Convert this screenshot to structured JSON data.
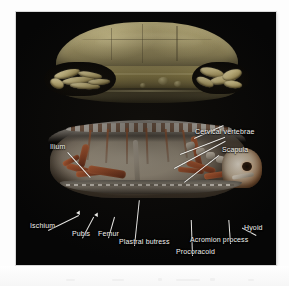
{
  "figure": {
    "background_color": "#060606",
    "panels": [
      {
        "id": "shell-view",
        "name": "external-shell-ct-render",
        "description": "Volume-rendered external view of turtle shell, lateral aspect",
        "palette": {
          "carapace": "#93885c",
          "bridge": "#7e7244",
          "bone": "#d6c78c",
          "shadow": "#2a2718"
        }
      },
      {
        "id": "skeleton-view",
        "name": "internal-skeleton-ct-render",
        "description": "Cutaway sagittal CT render showing internal skeleton of turtle",
        "palette": {
          "bone_red": "#a04d2a",
          "bone_pale": "#bcb2a2",
          "plastron": "#8a8276",
          "carapace_edge": "#a9a49c"
        }
      }
    ],
    "annotations": [
      {
        "id": "ilium",
        "label": "Ilium",
        "text_x": 50,
        "text_y": 147,
        "anchor_x": 84,
        "anchor_y": 178
      },
      {
        "id": "cervical-vertebrae",
        "label": "Cervical vertebrae",
        "text_x": 195,
        "text_y": 132,
        "anchor_x": 176,
        "anchor_y": 156
      },
      {
        "id": "scapula",
        "label": "Scapula",
        "text_x": 222,
        "text_y": 150,
        "anchor_x": 186,
        "anchor_y": 188
      },
      {
        "id": "ischium",
        "label": "Ischium",
        "text_x": 30,
        "text_y": 226,
        "anchor_x": 72,
        "anchor_y": 214
      },
      {
        "id": "pubis",
        "label": "Pubis",
        "text_x": 72,
        "text_y": 234,
        "anchor_x": 94,
        "anchor_y": 214
      },
      {
        "id": "femur",
        "label": "Femur",
        "text_x": 98,
        "text_y": 234,
        "anchor_x": 114,
        "anchor_y": 212
      },
      {
        "id": "plastral-butress",
        "label": "Plastral butress",
        "text_x": 119,
        "text_y": 242,
        "anchor_x": 140,
        "anchor_y": 196
      },
      {
        "id": "procoracoid",
        "label": "Procoracoid",
        "text_x": 176,
        "text_y": 252,
        "anchor_x": 184,
        "anchor_y": 214
      },
      {
        "id": "acromion-process",
        "label": "Acromion process",
        "text_x": 190,
        "text_y": 240,
        "anchor_x": 218,
        "anchor_y": 214
      },
      {
        "id": "hyoid",
        "label": "Hyoid",
        "text_x": 244,
        "text_y": 228,
        "anchor_x": 232,
        "anchor_y": 212
      }
    ]
  }
}
